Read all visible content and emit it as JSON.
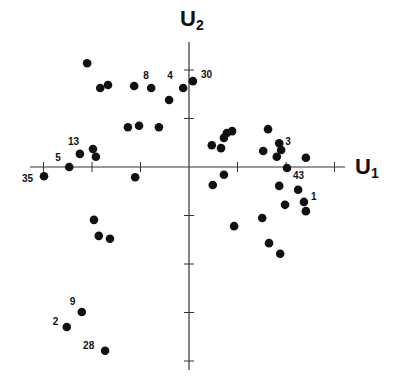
{
  "chart_data": {
    "type": "scatter",
    "title": "",
    "xlabel": "U1",
    "ylabel": "U2",
    "xlim": [
      -3.2,
      3.3
    ],
    "ylim": [
      -4.2,
      2.6
    ],
    "grid": false,
    "legend": null,
    "axes_through_origin": true,
    "tick_step": 1,
    "tick_labels_shown": false,
    "points": [
      {
        "x": -2.1,
        "y": 2.14,
        "label": ""
      },
      {
        "x": -1.83,
        "y": 1.63,
        "label": ""
      },
      {
        "x": -1.67,
        "y": 1.69,
        "label": ""
      },
      {
        "x": -1.13,
        "y": 1.67,
        "label": ""
      },
      {
        "x": -0.78,
        "y": 1.63,
        "label": "8"
      },
      {
        "x": -0.41,
        "y": 1.38,
        "label": ""
      },
      {
        "x": -0.12,
        "y": 1.63,
        "label": "4"
      },
      {
        "x": 0.08,
        "y": 1.77,
        "label": "30"
      },
      {
        "x": -1.26,
        "y": 0.82,
        "label": ""
      },
      {
        "x": -1.03,
        "y": 0.85,
        "label": ""
      },
      {
        "x": -0.62,
        "y": 0.82,
        "label": ""
      },
      {
        "x": -1.98,
        "y": 0.37,
        "label": ""
      },
      {
        "x": -1.92,
        "y": 0.21,
        "label": ""
      },
      {
        "x": -2.25,
        "y": 0.27,
        "label": "13"
      },
      {
        "x": -2.47,
        "y": 0.0,
        "label": "5"
      },
      {
        "x": -2.99,
        "y": -0.19,
        "label": "35"
      },
      {
        "x": -1.11,
        "y": -0.21,
        "label": ""
      },
      {
        "x": 0.47,
        "y": 0.45,
        "label": ""
      },
      {
        "x": 0.66,
        "y": 0.39,
        "label": ""
      },
      {
        "x": 0.72,
        "y": 0.6,
        "label": ""
      },
      {
        "x": 0.78,
        "y": 0.7,
        "label": ""
      },
      {
        "x": 0.89,
        "y": 0.74,
        "label": ""
      },
      {
        "x": 1.63,
        "y": 0.78,
        "label": ""
      },
      {
        "x": 1.53,
        "y": 0.33,
        "label": ""
      },
      {
        "x": 1.86,
        "y": 0.49,
        "label": "3"
      },
      {
        "x": 1.9,
        "y": 0.35,
        "label": ""
      },
      {
        "x": 1.81,
        "y": 0.21,
        "label": ""
      },
      {
        "x": 2.41,
        "y": 0.19,
        "label": ""
      },
      {
        "x": 2.02,
        "y": -0.02,
        "label": "43"
      },
      {
        "x": 0.49,
        "y": -0.37,
        "label": ""
      },
      {
        "x": 0.72,
        "y": -0.16,
        "label": ""
      },
      {
        "x": 1.86,
        "y": -0.39,
        "label": ""
      },
      {
        "x": 2.25,
        "y": -0.47,
        "label": ""
      },
      {
        "x": 2.37,
        "y": -0.72,
        "label": "1"
      },
      {
        "x": 2.41,
        "y": -0.91,
        "label": ""
      },
      {
        "x": 1.98,
        "y": -0.78,
        "label": ""
      },
      {
        "x": 1.51,
        "y": -1.05,
        "label": ""
      },
      {
        "x": 0.93,
        "y": -1.22,
        "label": ""
      },
      {
        "x": 1.65,
        "y": -1.57,
        "label": ""
      },
      {
        "x": 1.88,
        "y": -1.79,
        "label": ""
      },
      {
        "x": -1.96,
        "y": -1.09,
        "label": ""
      },
      {
        "x": -1.86,
        "y": -1.42,
        "label": ""
      },
      {
        "x": -1.63,
        "y": -1.48,
        "label": ""
      },
      {
        "x": -2.21,
        "y": -2.99,
        "label": "9"
      },
      {
        "x": -2.52,
        "y": -3.3,
        "label": "2"
      },
      {
        "x": -1.73,
        "y": -3.79,
        "label": "28"
      }
    ]
  },
  "axes": {
    "x_title_main": "U",
    "x_title_sub": "1",
    "y_title_main": "U",
    "y_title_sub": "2"
  },
  "colors": {
    "point": "#111111",
    "axis": "#333333",
    "background": "#ffffff"
  }
}
